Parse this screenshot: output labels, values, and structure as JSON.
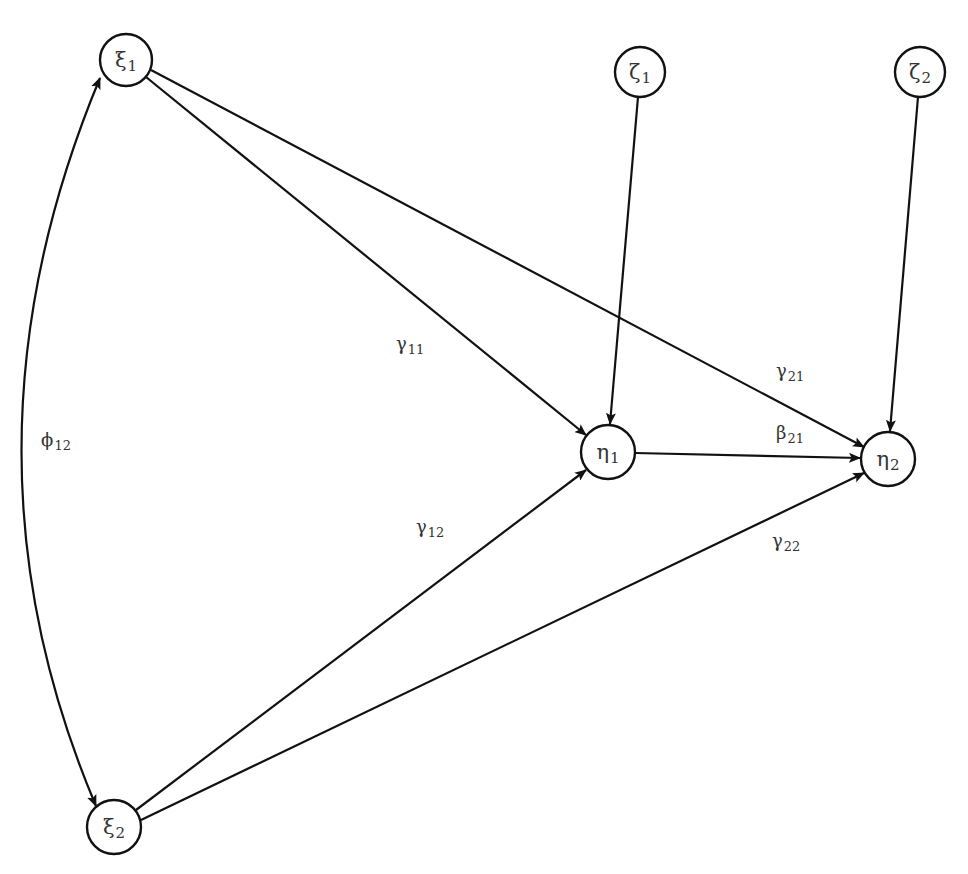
{
  "diagram": {
    "type": "structural-equation-path-diagram",
    "nodes": [
      {
        "id": "xi1",
        "symbol": "ξ",
        "subscript": "1",
        "cx": 126,
        "cy": 60,
        "r": 26
      },
      {
        "id": "zeta1",
        "symbol": "ζ",
        "subscript": "1",
        "cx": 640,
        "cy": 72,
        "r": 25
      },
      {
        "id": "zeta2",
        "symbol": "ζ",
        "subscript": "2",
        "cx": 920,
        "cy": 72,
        "r": 25
      },
      {
        "id": "eta1",
        "symbol": "η",
        "subscript": "1",
        "cx": 608,
        "cy": 452,
        "r": 27
      },
      {
        "id": "eta2",
        "symbol": "η",
        "subscript": "2",
        "cx": 888,
        "cy": 459,
        "r": 27
      },
      {
        "id": "xi2",
        "symbol": "ξ",
        "subscript": "2",
        "cx": 114,
        "cy": 827,
        "r": 27
      }
    ],
    "edges": [
      {
        "id": "gamma11",
        "from": "xi1",
        "to": "eta1",
        "symbol": "γ",
        "subscript": "11",
        "label_x": 410,
        "label_y": 344
      },
      {
        "id": "gamma21",
        "from": "xi1",
        "to": "eta2",
        "symbol": "γ",
        "subscript": "21",
        "label_x": 790,
        "label_y": 371
      },
      {
        "id": "zeta1_eta1",
        "from": "zeta1",
        "to": "eta1",
        "symbol": "",
        "subscript": ""
      },
      {
        "id": "zeta2_eta2",
        "from": "zeta2",
        "to": "eta2",
        "symbol": "",
        "subscript": ""
      },
      {
        "id": "beta21",
        "from": "eta1",
        "to": "eta2",
        "symbol": "β",
        "subscript": "21",
        "label_x": 790,
        "label_y": 433
      },
      {
        "id": "gamma12",
        "from": "xi2",
        "to": "eta1",
        "symbol": "γ",
        "subscript": "12",
        "label_x": 430,
        "label_y": 527
      },
      {
        "id": "gamma22",
        "from": "xi2",
        "to": "eta2",
        "symbol": "γ",
        "subscript": "22",
        "label_x": 786,
        "label_y": 541
      },
      {
        "id": "phi12",
        "from": "xi1",
        "to": "xi2",
        "symbol": "ϕ",
        "subscript": "12",
        "label_x": 56,
        "label_y": 440,
        "bidirectional": true,
        "curved": true
      }
    ]
  },
  "labels": {
    "xi1": {
      "sym": "ξ",
      "sub": "1"
    },
    "zeta1": {
      "sym": "ζ",
      "sub": "1"
    },
    "zeta2": {
      "sym": "ζ",
      "sub": "2"
    },
    "eta1": {
      "sym": "η",
      "sub": "1"
    },
    "eta2": {
      "sym": "η",
      "sub": "2"
    },
    "xi2": {
      "sym": "ξ",
      "sub": "2"
    },
    "gamma11": {
      "sym": "γ",
      "sub": "11"
    },
    "gamma21": {
      "sym": "γ",
      "sub": "21"
    },
    "beta21": {
      "sym": "β",
      "sub": "21"
    },
    "gamma12": {
      "sym": "γ",
      "sub": "12"
    },
    "gamma22": {
      "sym": "γ",
      "sub": "22"
    },
    "phi12": {
      "sym": "ϕ",
      "sub": "12"
    }
  },
  "colors": {
    "stroke": "#111111",
    "text": "#333333",
    "background": "#ffffff"
  }
}
